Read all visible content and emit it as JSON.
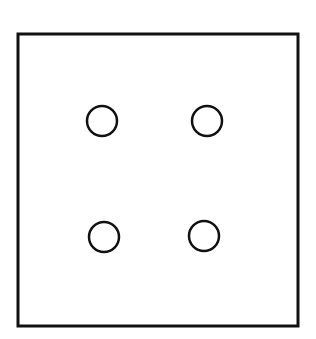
{
  "diagram": {
    "background": "#ffffff",
    "stroke_color": "#111111",
    "square": {
      "x": 18,
      "y": 34,
      "width": 280,
      "height": 292,
      "stroke_width": 3
    },
    "circles": [
      {
        "cx": 102,
        "cy": 121,
        "r": 15,
        "stroke_width": 2.5
      },
      {
        "cx": 207,
        "cy": 121,
        "r": 15,
        "stroke_width": 2.5
      },
      {
        "cx": 104,
        "cy": 237,
        "r": 15,
        "stroke_width": 2.5
      },
      {
        "cx": 204,
        "cy": 236,
        "r": 15,
        "stroke_width": 2.5
      }
    ]
  }
}
